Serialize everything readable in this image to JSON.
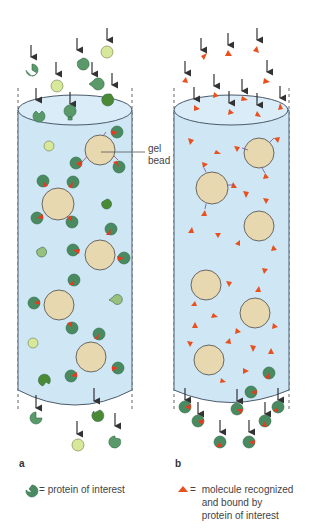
{
  "panels": {
    "a": {
      "label": "a"
    },
    "b": {
      "label": "b"
    }
  },
  "annotations": {
    "gel_bead_line1": "gel",
    "gel_bead_line2": "bead"
  },
  "legend": {
    "a": {
      "symbol": "green-pacman-protein",
      "equals": "=",
      "text": "protein of interest"
    },
    "b": {
      "symbol": "orange-triangle-molecule",
      "equals": "=",
      "line1": "molecule recognized",
      "line2": "and bound by",
      "line3": "protein of interest"
    }
  },
  "colors": {
    "column_fill": "#cfe6f5",
    "column_stroke": "#4a5a6a",
    "bead_fill": "#e8d8b0",
    "protein_green": "#5a9a6a",
    "protein_dark": "#2f6a45",
    "decoy_yellow": "#d8e89a",
    "molecule_orange": "#e8501e",
    "arrow": "#333333"
  }
}
